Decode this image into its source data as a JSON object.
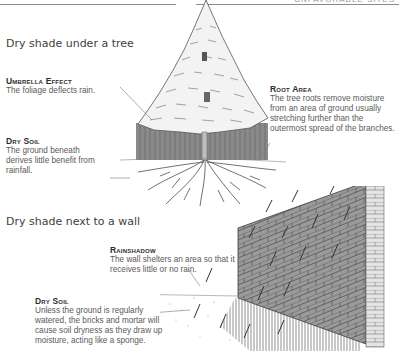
{
  "header": {
    "running_head": "Unfavorable Sites"
  },
  "sections": [
    {
      "heading": "Dry shade under a tree",
      "callouts": [
        {
          "title": "Umbrella Effect",
          "body": "The foliage deflects rain."
        },
        {
          "title": "Dry Soil",
          "body": "The ground beneath derives little benefit from rainfall."
        },
        {
          "title": "Root Area",
          "body": "The tree roots remove moisture from an area of ground usually stretching further than the outermost spread of the branches."
        }
      ]
    },
    {
      "heading": "Dry shade next to a wall",
      "callouts": [
        {
          "title": "Rainshadow",
          "body": "The wall shelters an area so that it receives little or no rain."
        },
        {
          "title": "Dry Soil",
          "body": "Unless the ground is regularly watered, the bricks and mortar will cause soil dryness as they draw up moisture, acting like a sponge."
        }
      ]
    }
  ],
  "illustrations": [
    {
      "name": "conifer-tree-with-roots",
      "description": "Conifer tree with shaded rain-shadow column and spreading roots"
    },
    {
      "name": "brick-wall-with-rain",
      "description": "Brick wall in perspective with diagonal rain and hatched dry ground"
    }
  ],
  "colors": {
    "text": "#4a4a4a",
    "heading": "#3e3e3e",
    "rule": "#8a8a8a",
    "shadow_column": "#7a7a7a",
    "brick": "#8c8c8c"
  }
}
